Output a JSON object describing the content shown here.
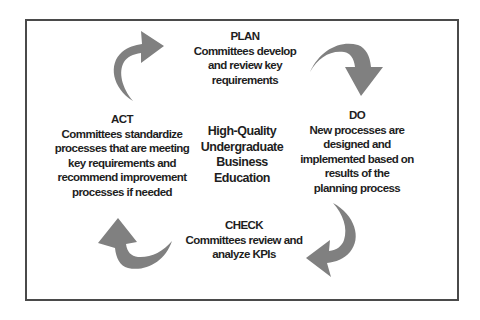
{
  "diagram": {
    "type": "PDCA cycle",
    "center": {
      "lines": [
        "High-Quality",
        "Undergraduate",
        "Business",
        "Education"
      ]
    },
    "stages": {
      "plan": {
        "title": "PLAN",
        "lines": [
          "Committees develop",
          "and review key",
          "requirements"
        ]
      },
      "do": {
        "title": "DO",
        "lines": [
          "New processes are",
          "designed and",
          "implemented based on",
          "results of the",
          "planning process"
        ]
      },
      "check": {
        "title": "CHECK",
        "lines": [
          "Committees review and",
          "analyze KPIs"
        ]
      },
      "act": {
        "title": "ACT",
        "lines": [
          "Committees standardize",
          "processes that are meeting",
          "key requirements and",
          "recommend improvement",
          "processes if needed"
        ]
      }
    },
    "arrows": [
      {
        "from": "ACT",
        "to": "PLAN",
        "icon": "curved-arrow-right-icon"
      },
      {
        "from": "PLAN",
        "to": "DO",
        "icon": "curved-arrow-down-icon"
      },
      {
        "from": "DO",
        "to": "CHECK",
        "icon": "curved-arrow-left-icon"
      },
      {
        "from": "CHECK",
        "to": "ACT",
        "icon": "curved-arrow-up-icon"
      }
    ],
    "colors": {
      "arrow": "#808080",
      "text": "#1e1e1e",
      "border": "#4a4a4a",
      "background": "#ffffff"
    }
  }
}
